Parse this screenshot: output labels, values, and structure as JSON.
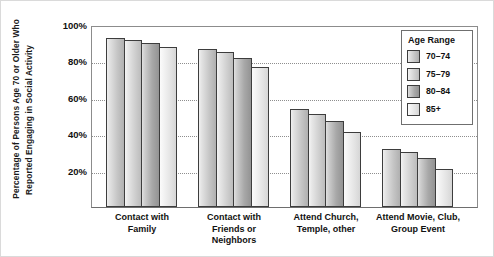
{
  "chart_data": {
    "type": "bar",
    "title": "",
    "xlabel": "",
    "ylabel": "Percentage of Persons Age 70 or Older Who Reported Engaging in Social Activity",
    "ylabel_line1": "Percentage of Persons Age 70 or Older Who",
    "ylabel_line2": "Reported Engaging in Social Activity",
    "ylim": [
      0,
      100
    ],
    "yticks": [
      "20%",
      "40%",
      "60%",
      "80%",
      "100%"
    ],
    "ytick_values": [
      20,
      40,
      60,
      80,
      100
    ],
    "grid": "horizontal-dotted",
    "legend_position": "top-right",
    "legend_title": "Age Range",
    "categories": [
      "Contact with Family",
      "Contact with Friends or Neighbors",
      "Attend Church, Temple, other",
      "Attend Movie, Club, Group Event"
    ],
    "category_lines": [
      [
        "Contact with",
        "Family"
      ],
      [
        "Contact with",
        "Friends or",
        "Neighbors"
      ],
      [
        "Attend Church,",
        "Temple, other"
      ],
      [
        "Attend Movie, Club,",
        "Group Event"
      ]
    ],
    "series": [
      {
        "name": "70–74",
        "values": [
          93,
          87,
          54,
          32
        ]
      },
      {
        "name": "75–79",
        "values": [
          92,
          85,
          51,
          30
        ]
      },
      {
        "name": "80–84",
        "values": [
          90,
          82,
          47,
          27
        ]
      },
      {
        "name": "85+",
        "values": [
          88,
          77,
          41,
          21
        ]
      }
    ],
    "colors": {
      "series_70_74": "#cccccc",
      "series_75_79": "#d4d4d4",
      "series_80_84": "#ababab",
      "series_85_plus": "#eeeeee",
      "axis": "#6e6e6e",
      "gridline": "#8e8e8e",
      "text": "#111111",
      "background": "#ffffff"
    }
  },
  "legend": {
    "title": "Age Range",
    "items": [
      {
        "label": "70–74"
      },
      {
        "label": "75–79"
      },
      {
        "label": "80–84"
      },
      {
        "label": "85+"
      }
    ]
  }
}
